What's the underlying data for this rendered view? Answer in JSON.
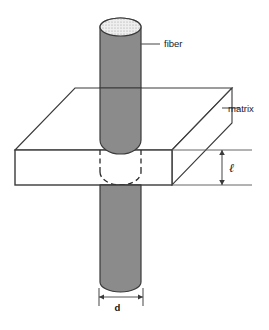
{
  "figure": {
    "type": "technical-diagram",
    "background_color": "#ffffff"
  },
  "labels": {
    "fiber": "fiber",
    "matrix": "matrix",
    "length_symbol": "ℓ",
    "diameter_symbol": "d"
  },
  "colors": {
    "fiber_fill": "#8b8b8b",
    "fiber_cap_fill": "#ebebeb",
    "matrix_fill": "#ffffff",
    "outline": "#3a3a3a",
    "dashed_outline": "#2b2b2b",
    "leader_line": "#555555",
    "text": "#111111"
  },
  "geometry": {
    "fiber": {
      "left_x": 100,
      "right_x": 141,
      "top_y": 18,
      "bottom_y": 292,
      "cap_ry": 9,
      "embedded_top_y": 150,
      "embedded_bottom_y": 185
    },
    "matrix_box": {
      "front_left_x": 15,
      "front_right_x": 172,
      "front_top_y": 150,
      "front_bottom_y": 185,
      "depth_dx": 60,
      "depth_dy": -62
    },
    "dimension_l": {
      "x": 222,
      "top_y": 150,
      "bottom_y": 185,
      "extension_right_x": 252
    },
    "dimension_d": {
      "y": 297,
      "left_x": 99,
      "right_x": 143,
      "tick_top_y": 288,
      "tick_bottom_y": 306
    },
    "fiber_leader": {
      "x1": 140,
      "y1": 44,
      "x2": 160,
      "y2": 44,
      "text_x": 164,
      "text_y": 47
    },
    "matrix_leader": {
      "x1": 222,
      "y1": 108,
      "x2": 240,
      "y2": 108,
      "text_x": 228,
      "text_y": 111
    }
  }
}
